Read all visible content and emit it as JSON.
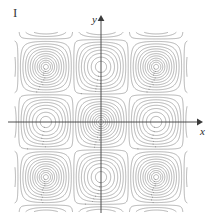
{
  "figure": {
    "panel_label": "I",
    "background_color": "#ffffff",
    "contour_color": "#8a8a8a",
    "axis_color": "#3a3a3a"
  },
  "axes": {
    "x_label": "x",
    "y_label": "y",
    "x_axis": {
      "x_start": 8,
      "x_end": 200,
      "y": 122,
      "arrow": "right"
    },
    "y_axis": {
      "y_start": 18,
      "y_end": 213,
      "x": 101,
      "arrow": "up"
    },
    "origin": {
      "x": 101,
      "y": 122
    }
  },
  "plot_area": {
    "left": 18,
    "top": 28,
    "right": 190,
    "bottom": 207
  },
  "chart_data": {
    "type": "contour",
    "title": "",
    "xlabel": "x",
    "ylabel": "y",
    "grid": false,
    "legend": "none",
    "function": "f(x,y) = cos(x) * cos(y) style doubly-periodic surface",
    "xlim": [
      -4.9,
      4.9
    ],
    "ylim": [
      -5.1,
      5.1
    ],
    "levels": [
      -0.95,
      -0.85,
      -0.72,
      -0.58,
      -0.44,
      -0.3,
      -0.16,
      -0.02,
      0.12,
      0.26,
      0.4,
      0.52,
      0.63,
      0.73,
      0.81,
      0.88,
      0.93,
      0.965,
      0.99
    ],
    "features": [
      {
        "type": "maximum",
        "x": 0,
        "y": 0,
        "note": "concentric closed ellipses about the origin, elongated vertically"
      },
      {
        "type": "saddle",
        "x": -3.14,
        "y": 0,
        "note": "saddle point on the negative x-axis"
      },
      {
        "type": "saddle",
        "x": 3.14,
        "y": 0,
        "note": "saddle point on the positive x-axis"
      },
      {
        "type": "minimum",
        "x": -4.9,
        "y": 0,
        "note": "partial closed curves at left edge of frame"
      },
      {
        "type": "minimum",
        "x": 4.9,
        "y": 0,
        "note": "partial closed curves at right edge of frame"
      }
    ]
  }
}
